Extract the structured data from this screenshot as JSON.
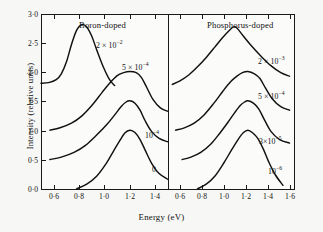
{
  "figure": {
    "axis": {
      "y_title": "Intensity (relative units)",
      "x_title": "Energy  (eV)",
      "y_ticks": [
        "3·0",
        "2·5",
        "2·0",
        "1·5",
        "1·0",
        "0·5",
        "0·0"
      ],
      "x_ticks_left": [
        "0·6",
        "0·8",
        "1·0",
        "1·2",
        "1·4"
      ],
      "x_ticks_right": [
        "0·6",
        "0·8",
        "1·0",
        "1·2",
        "1·4",
        "1·6"
      ]
    },
    "panels": [
      {
        "id": "boron",
        "title": "Boron-doped",
        "labels": [
          {
            "id": "boron-2e-2",
            "mantissa": "2 × 10",
            "exponent": "−2"
          },
          {
            "id": "boron-5e-4",
            "mantissa": "5 × 10",
            "exponent": "−4"
          },
          {
            "id": "boron-1e-4",
            "mantissa": "10",
            "exponent": "−4"
          },
          {
            "id": "boron-0",
            "mantissa": "0",
            "exponent": ""
          }
        ]
      },
      {
        "id": "phosphorus",
        "title": "Phosphorus-doped",
        "labels": [
          {
            "id": "phos-2e-3",
            "mantissa": "2 × 10",
            "exponent": "−3"
          },
          {
            "id": "phos-5e-4",
            "mantissa": "5 × 10",
            "exponent": "−4"
          },
          {
            "id": "phos-3e-5",
            "mantissa": "3×10",
            "exponent": "−5"
          },
          {
            "id": "phos-1e-6",
            "mantissa": "10",
            "exponent": "−6"
          }
        ]
      }
    ]
  },
  "chart_data": {
    "type": "line",
    "xlabel": "Energy  (eV)",
    "ylabel": "Intensity (relative units)",
    "ylim": [
      0.0,
      3.0
    ],
    "yticks": [
      0.0,
      0.5,
      1.0,
      1.5,
      2.0,
      2.5,
      3.0
    ],
    "grid": false,
    "legend": "inline-curve-labels",
    "panels": [
      {
        "name": "Boron-doped",
        "xlim": [
          0.5,
          1.5
        ],
        "xticks": [
          0.6,
          0.8,
          1.0,
          1.2,
          1.4
        ],
        "series": [
          {
            "name": "2 × 10⁻²",
            "baseline": 1.82,
            "peak_x": 0.82,
            "peak_y": 2.82,
            "x": [
              0.5,
              0.56,
              0.62,
              0.66,
              0.7,
              0.74,
              0.78,
              0.82,
              0.86,
              0.9,
              0.94,
              0.99,
              1.04,
              1.08
            ],
            "y": [
              1.82,
              1.83,
              1.88,
              1.98,
              2.18,
              2.48,
              2.72,
              2.82,
              2.78,
              2.62,
              2.38,
              2.1,
              1.88,
              1.78
            ]
          },
          {
            "name": "5 × 10⁻⁴",
            "baseline": 1.02,
            "peak_x": 1.2,
            "peak_y": 2.02,
            "x": [
              0.57,
              0.65,
              0.74,
              0.82,
              0.9,
              0.98,
              1.04,
              1.1,
              1.15,
              1.2,
              1.25,
              1.29,
              1.33,
              1.38,
              1.44,
              1.5
            ],
            "y": [
              1.02,
              1.06,
              1.14,
              1.26,
              1.44,
              1.66,
              1.82,
              1.95,
              2.0,
              2.02,
              2.0,
              1.92,
              1.76,
              1.55,
              1.4,
              1.34
            ]
          },
          {
            "name": "10⁻⁴",
            "baseline": 0.52,
            "peak_x": 1.2,
            "peak_y": 1.52,
            "x": [
              0.57,
              0.66,
              0.76,
              0.85,
              0.94,
              1.02,
              1.08,
              1.13,
              1.17,
              1.2,
              1.24,
              1.28,
              1.32,
              1.37,
              1.43,
              1.5
            ],
            "y": [
              0.52,
              0.56,
              0.64,
              0.76,
              0.94,
              1.12,
              1.28,
              1.42,
              1.5,
              1.52,
              1.48,
              1.36,
              1.18,
              1.0,
              0.88,
              0.82
            ]
          },
          {
            "name": "0",
            "baseline": 0.02,
            "peak_x": 1.2,
            "peak_y": 1.02,
            "x": [
              0.78,
              0.86,
              0.94,
              1.01,
              1.07,
              1.12,
              1.16,
              1.2,
              1.24,
              1.28,
              1.32,
              1.37,
              1.43,
              1.5
            ],
            "y": [
              0.02,
              0.1,
              0.24,
              0.44,
              0.66,
              0.84,
              0.97,
              1.02,
              0.98,
              0.86,
              0.68,
              0.46,
              0.28,
              0.18
            ]
          }
        ]
      },
      {
        "name": "Phosphorus-doped",
        "xlim": [
          0.5,
          1.65
        ],
        "xticks": [
          0.6,
          0.8,
          1.0,
          1.2,
          1.4,
          1.6
        ],
        "series": [
          {
            "name": "2 × 10⁻³",
            "baseline": 1.8,
            "peak_x": 1.12,
            "peak_y": 2.78,
            "x": [
              0.53,
              0.6,
              0.68,
              0.76,
              0.84,
              0.92,
              0.99,
              1.05,
              1.09,
              1.12,
              1.18,
              1.26,
              1.34,
              1.43,
              1.52,
              1.6
            ],
            "y": [
              1.8,
              1.86,
              1.96,
              2.1,
              2.26,
              2.44,
              2.6,
              2.72,
              2.78,
              2.76,
              2.62,
              2.44,
              2.28,
              2.12,
              2.0,
              1.94
            ]
          },
          {
            "name": "5 × 10⁻⁴",
            "baseline": 1.02,
            "peak_x": 1.22,
            "peak_y": 2.02,
            "x": [
              0.56,
              0.64,
              0.73,
              0.82,
              0.91,
              0.99,
              1.06,
              1.12,
              1.17,
              1.22,
              1.28,
              1.33,
              1.38,
              1.44,
              1.52,
              1.6
            ],
            "y": [
              1.02,
              1.06,
              1.14,
              1.28,
              1.48,
              1.68,
              1.84,
              1.94,
              2.0,
              2.02,
              1.98,
              1.9,
              1.74,
              1.56,
              1.42,
              1.36
            ]
          },
          {
            "name": "3×10⁻⁵",
            "baseline": 0.52,
            "peak_x": 1.22,
            "peak_y": 1.52,
            "x": [
              0.62,
              0.7,
              0.79,
              0.88,
              0.96,
              1.04,
              1.1,
              1.15,
              1.19,
              1.22,
              1.27,
              1.32,
              1.37,
              1.43,
              1.51,
              1.6
            ],
            "y": [
              0.52,
              0.56,
              0.64,
              0.78,
              0.96,
              1.16,
              1.32,
              1.44,
              1.5,
              1.52,
              1.48,
              1.38,
              1.2,
              1.0,
              0.86,
              0.8
            ]
          },
          {
            "name": "10⁻⁶",
            "baseline": 0.02,
            "peak_x": 1.22,
            "peak_y": 1.02,
            "x": [
              0.76,
              0.84,
              0.92,
              1.0,
              1.07,
              1.13,
              1.18,
              1.22,
              1.26,
              1.31,
              1.36,
              1.41,
              1.47,
              1.54
            ],
            "y": [
              0.02,
              0.1,
              0.24,
              0.46,
              0.68,
              0.86,
              0.98,
              1.02,
              0.98,
              0.88,
              0.7,
              0.48,
              0.26,
              0.08
            ]
          }
        ]
      }
    ]
  }
}
